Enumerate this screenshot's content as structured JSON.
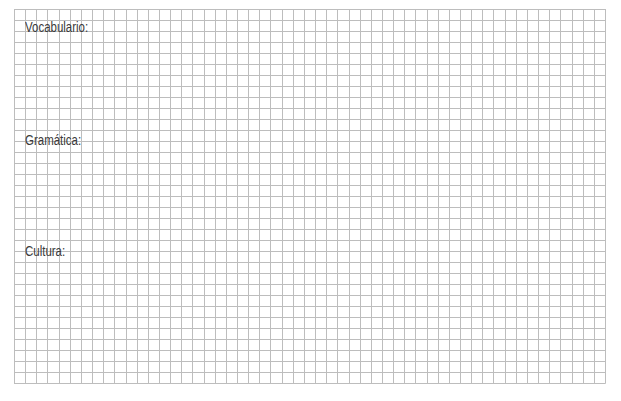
{
  "worksheet": {
    "background_color": "#ffffff",
    "grid": {
      "line_color": "#bdbdbd",
      "left": 14,
      "top": 9,
      "right": 605,
      "bottom": 383,
      "columns": 53,
      "rows": 34
    },
    "sections": [
      {
        "label": "Vocabulario:",
        "top": 20
      },
      {
        "label": "Gramática:",
        "top": 133
      },
      {
        "label": "Cultura:",
        "top": 244
      }
    ],
    "text_color": "#3a3a3a"
  }
}
